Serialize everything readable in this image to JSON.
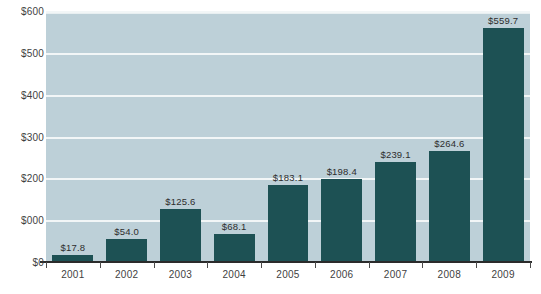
{
  "chart_data": {
    "type": "bar",
    "title": "",
    "xlabel": "",
    "ylabel": "",
    "categories": [
      "2001",
      "2002",
      "2003",
      "2004",
      "2005",
      "2006",
      "2007",
      "2008",
      "2009"
    ],
    "values": [
      17.8,
      54.0,
      125.6,
      68.1,
      183.1,
      198.4,
      239.1,
      264.6,
      559.7
    ],
    "value_labels": [
      "$17.8",
      "$54.0",
      "$125.6",
      "$68.1",
      "$183.1",
      "$198.4",
      "$239.1",
      "$264.6",
      "$559.7"
    ],
    "ylim": [
      0,
      600
    ],
    "y_ticks": [
      0,
      100,
      200,
      300,
      400,
      500,
      600
    ],
    "y_tick_labels": [
      "$0",
      "$000",
      "$200",
      "$300",
      "$400",
      "$500",
      "$600"
    ],
    "grid": true,
    "legend": "none",
    "colors": {
      "bar": "#1d5154",
      "plot_background": "#bdd0d8",
      "gridline": "#f2f6f7",
      "axis": "#2b2b2b",
      "text": "#3f3f3f",
      "page_background": "#ffffff"
    }
  },
  "fragments": {
    "title_cropped": "",
    "caption_cropped": ""
  }
}
